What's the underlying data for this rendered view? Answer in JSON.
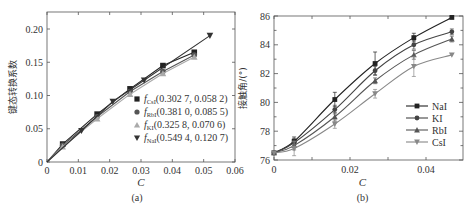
{
  "chart_data": [
    {
      "type": "line",
      "panel_label": "(a)",
      "xlabel": "C",
      "ylabel": "键态转换系数",
      "xlim": [
        0,
        0.06
      ],
      "ylim": [
        0,
        0.22
      ],
      "xticks": [
        "0",
        "0.01",
        "0.02",
        "0.03",
        "0.04",
        "0.05",
        "0.06"
      ],
      "xtick_values": [
        0,
        0.01,
        0.02,
        0.03,
        0.04,
        0.05,
        0.06
      ],
      "yticks": [
        "0",
        "0.05",
        "0.10",
        "0.15",
        "0.20"
      ],
      "ytick_values": [
        0,
        0.05,
        0.1,
        0.15,
        0.2
      ],
      "legend_position": "lower-right",
      "series": [
        {
          "name": "CsI",
          "legend_sub": "CsI",
          "legend_text": "(0.302 7, 0.058 2)",
          "marker": "square",
          "color": "#222222",
          "x": [
            0,
            0.005,
            0.016,
            0.0265,
            0.037,
            0.047
          ],
          "y": [
            0,
            0.027,
            0.072,
            0.11,
            0.145,
            0.165
          ]
        },
        {
          "name": "RbI",
          "legend_sub": "RbI",
          "legend_text": "(0.381 0, 0.085 5)",
          "marker": "circle",
          "color": "#555555",
          "x": [
            0,
            0.005,
            0.016,
            0.0265,
            0.037,
            0.047
          ],
          "y": [
            0,
            0.025,
            0.068,
            0.106,
            0.136,
            0.161
          ]
        },
        {
          "name": "KI",
          "legend_sub": "KI",
          "legend_text": "(0.325 8, 0.070 6)",
          "marker": "triangle-up",
          "color": "#aaaaaa",
          "x": [
            0,
            0.005,
            0.016,
            0.0265,
            0.037,
            0.047
          ],
          "y": [
            0,
            0.023,
            0.065,
            0.102,
            0.133,
            0.158
          ]
        },
        {
          "name": "NaI",
          "legend_sub": "NaI",
          "legend_text": "(0.549 4, 0.120 7)",
          "marker": "triangle-down",
          "color": "#333333",
          "x": [
            0,
            0.011,
            0.021,
            0.031,
            0.052
          ],
          "y": [
            0,
            0.047,
            0.091,
            0.123,
            0.19
          ]
        }
      ]
    },
    {
      "type": "line",
      "panel_label": "(b)",
      "xlabel": "C",
      "ylabel": "接触角/(°)",
      "xlim": [
        0,
        0.05
      ],
      "ylim": [
        76,
        86
      ],
      "xticks": [
        "0",
        "0.02",
        "0.04"
      ],
      "xtick_values": [
        0,
        0.02,
        0.04
      ],
      "yticks": [
        "76",
        "78",
        "80",
        "82",
        "84",
        "86"
      ],
      "ytick_values": [
        76,
        78,
        80,
        82,
        84,
        86
      ],
      "legend_position": "lower-right",
      "series": [
        {
          "name": "NaI",
          "marker": "square",
          "color": "#222222",
          "x": [
            0,
            0.0053,
            0.016,
            0.0266,
            0.0368,
            0.0468
          ],
          "y": [
            76.5,
            77.3,
            80.2,
            82.7,
            84.5,
            85.9
          ],
          "err": [
            0,
            0.3,
            0.5,
            0.8,
            0.3,
            0
          ]
        },
        {
          "name": "KI",
          "marker": "circle",
          "color": "#444444",
          "x": [
            0,
            0.0053,
            0.016,
            0.0266,
            0.0368,
            0.0468
          ],
          "y": [
            76.5,
            77.2,
            79.5,
            82.2,
            84.0,
            84.9
          ],
          "err": [
            0,
            0.3,
            0.3,
            0.3,
            0.3,
            0.2
          ]
        },
        {
          "name": "RbI",
          "marker": "triangle-up",
          "color": "#555555",
          "x": [
            0,
            0.0053,
            0.016,
            0.0266,
            0.0368,
            0.0468
          ],
          "y": [
            76.5,
            77.0,
            79.0,
            81.5,
            83.3,
            84.4
          ],
          "err": [
            0,
            0.3,
            0.3,
            0.2,
            0.3,
            0.2
          ]
        },
        {
          "name": "CsI",
          "marker": "triangle-down",
          "color": "#888888",
          "x": [
            0,
            0.0053,
            0.016,
            0.0266,
            0.0368,
            0.0468
          ],
          "y": [
            76.5,
            76.8,
            78.5,
            80.6,
            82.5,
            83.3
          ],
          "err": [
            0,
            0.5,
            0.3,
            0.3,
            0.7,
            0
          ]
        }
      ]
    }
  ]
}
